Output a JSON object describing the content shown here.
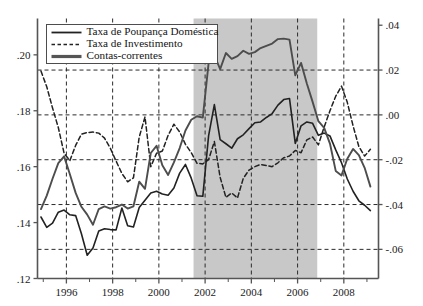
{
  "chart_data": {
    "type": "line",
    "title": "",
    "subtitle": "",
    "xlabel": "",
    "ylabel": "",
    "y2label": "",
    "grid": true,
    "legend_position": "top-left",
    "xlim": [
      1994.75,
      2009.5
    ],
    "ylim": [
      0.12,
      0.213
    ],
    "y2lim": [
      -0.073,
      0.043
    ],
    "xticks": [
      1996,
      1998,
      2000,
      2002,
      2004,
      2006,
      2008
    ],
    "xticklabels": [
      "1996",
      "1998",
      "2000",
      "2002",
      "2004",
      "2006",
      "2008"
    ],
    "xminorticks": [
      1995,
      1997,
      1999,
      2001,
      2003,
      2005,
      2007,
      2009
    ],
    "yticks": [
      0.12,
      0.14,
      0.16,
      0.18,
      0.2
    ],
    "yticklabels": [
      ".12",
      ".14",
      ".16",
      ".18",
      ".20"
    ],
    "y2ticks": [
      -0.06,
      -0.04,
      -0.02,
      0.0,
      0.02,
      0.04
    ],
    "y2ticklabels": [
      "-.06",
      "-.04",
      "-.02",
      ".00",
      ".02",
      ".04"
    ],
    "shaded_regions": [
      {
        "x0": 2001.5,
        "x1": 2006.85,
        "color": "#c8c8c8",
        "label": ""
      }
    ],
    "legend": [
      {
        "label": "Taxa de Poupança Doméstica",
        "style": "solid",
        "width": 1.6,
        "color": "#222222"
      },
      {
        "label": "Taxa de Investimento",
        "style": "dashed",
        "width": 1.4,
        "color": "#222222"
      },
      {
        "label": "Contas-correntes",
        "style": "thick-solid",
        "width": 3.2,
        "color": "#555555"
      }
    ],
    "series": [
      {
        "name": "Taxa de Poupança Doméstica",
        "axis": "left",
        "style": "solid",
        "color": "#222222",
        "x": [
          1994.9,
          1995.15,
          1995.4,
          1995.65,
          1995.9,
          1996.15,
          1996.4,
          1996.65,
          1996.9,
          1997.15,
          1997.4,
          1997.65,
          1997.9,
          1998.15,
          1998.4,
          1998.65,
          1998.9,
          1999.15,
          1999.4,
          1999.65,
          1999.9,
          2000.15,
          2000.4,
          2000.65,
          2000.9,
          2001.15,
          2001.4,
          2001.65,
          2001.9,
          2002.15,
          2002.4,
          2002.65,
          2002.9,
          2003.15,
          2003.4,
          2003.65,
          2003.9,
          2004.15,
          2004.4,
          2004.65,
          2004.9,
          2005.15,
          2005.4,
          2005.65,
          2005.9,
          2006.15,
          2006.4,
          2006.65,
          2006.9,
          2007.15,
          2007.4,
          2007.65,
          2007.9,
          2008.15,
          2008.4,
          2008.65,
          2008.9,
          2009.15
        ],
        "values": [
          0.142,
          0.1383,
          0.1398,
          0.1437,
          0.1445,
          0.1428,
          0.1425,
          0.136,
          0.1283,
          0.1309,
          0.137,
          0.1378,
          0.1375,
          0.1374,
          0.1452,
          0.1389,
          0.1384,
          0.1454,
          0.148,
          0.1506,
          0.1512,
          0.1502,
          0.1498,
          0.1524,
          0.1577,
          0.1608,
          0.1559,
          0.1496,
          0.1494,
          0.171,
          0.1822,
          0.1697,
          0.1682,
          0.1666,
          0.17,
          0.1714,
          0.1736,
          0.1757,
          0.176,
          0.1776,
          0.179,
          0.182,
          0.184,
          0.1844,
          0.1683,
          0.1746,
          0.176,
          0.1755,
          0.1712,
          0.172,
          0.171,
          0.166,
          0.1614,
          0.1556,
          0.1512,
          0.1478,
          0.1462,
          0.1443
        ]
      },
      {
        "name": "Taxa de Investimento",
        "axis": "left",
        "style": "dashed",
        "color": "#222222",
        "x": [
          1994.9,
          1995.15,
          1995.4,
          1995.65,
          1995.9,
          1996.15,
          1996.4,
          1996.65,
          1996.9,
          1997.15,
          1997.4,
          1997.65,
          1997.9,
          1998.15,
          1998.4,
          1998.65,
          1998.9,
          1999.15,
          1999.4,
          1999.65,
          1999.9,
          2000.15,
          2000.4,
          2000.65,
          2000.9,
          2001.15,
          2001.4,
          2001.65,
          2001.9,
          2002.15,
          2002.4,
          2002.65,
          2002.9,
          2003.15,
          2003.4,
          2003.65,
          2003.9,
          2004.15,
          2004.4,
          2004.65,
          2004.9,
          2005.15,
          2005.4,
          2005.65,
          2005.9,
          2006.15,
          2006.4,
          2006.65,
          2006.9,
          2007.15,
          2007.4,
          2007.65,
          2007.9,
          2008.15,
          2008.4,
          2008.65,
          2008.9,
          2009.15
        ],
        "values": [
          0.1942,
          0.1886,
          0.181,
          0.174,
          0.1648,
          0.1622,
          0.1676,
          0.1716,
          0.1722,
          0.1724,
          0.172,
          0.1702,
          0.1666,
          0.162,
          0.1576,
          0.1546,
          0.156,
          0.1706,
          0.1778,
          0.16,
          0.1648,
          0.1656,
          0.1712,
          0.1752,
          0.1724,
          0.168,
          0.165,
          0.1612,
          0.161,
          0.1625,
          0.169,
          0.1562,
          0.149,
          0.1506,
          0.1488,
          0.1558,
          0.1588,
          0.16,
          0.1608,
          0.1604,
          0.16,
          0.1614,
          0.1632,
          0.1638,
          0.1658,
          0.165,
          0.1696,
          0.1706,
          0.1678,
          0.1742,
          0.18,
          0.1852,
          0.1888,
          0.183,
          0.1746,
          0.1672,
          0.1638,
          0.1662
        ]
      },
      {
        "name": "Contas-correntes",
        "axis": "right",
        "style": "thick-solid",
        "color": "#4d4d4d",
        "x": [
          1994.9,
          1995.15,
          1995.4,
          1995.65,
          1995.9,
          1996.15,
          1996.4,
          1996.65,
          1996.9,
          1997.15,
          1997.4,
          1997.65,
          1997.9,
          1998.15,
          1998.4,
          1998.65,
          1998.9,
          1999.15,
          1999.4,
          1999.65,
          1999.9,
          2000.15,
          2000.4,
          2000.65,
          2000.9,
          2001.15,
          2001.4,
          2001.65,
          2001.9,
          2002.15,
          2002.4,
          2002.65,
          2002.9,
          2003.15,
          2003.4,
          2003.65,
          2003.9,
          2004.15,
          2004.4,
          2004.65,
          2004.9,
          2005.15,
          2005.4,
          2005.65,
          2005.9,
          2006.15,
          2006.4,
          2006.65,
          2006.9,
          2007.15,
          2007.4,
          2007.65,
          2007.9,
          2008.15,
          2008.4,
          2008.65,
          2008.9,
          2009.15
        ],
        "values": [
          -0.042,
          -0.036,
          -0.0285,
          -0.0215,
          -0.0185,
          -0.0265,
          -0.0348,
          -0.041,
          -0.0445,
          -0.049,
          -0.042,
          -0.0408,
          -0.0418,
          -0.0412,
          -0.04,
          -0.0418,
          -0.0408,
          -0.0298,
          -0.033,
          -0.017,
          -0.0138,
          -0.0225,
          -0.0268,
          -0.0212,
          -0.0148,
          -0.007,
          -0.0022,
          -0.0006,
          -0.0012,
          0.023,
          0.0266,
          0.0204,
          0.0276,
          0.025,
          0.0262,
          0.0286,
          0.0272,
          0.028,
          0.0298,
          0.0308,
          0.0318,
          0.0338,
          0.034,
          0.0336,
          0.0176,
          0.0232,
          0.014,
          0.0058,
          -0.0028,
          -0.0058,
          -0.0128,
          -0.025,
          -0.027,
          -0.0196,
          -0.0152,
          -0.018,
          -0.0236,
          -0.032
        ]
      }
    ]
  },
  "colors": {
    "background": "#ffffff",
    "axis": "#555555",
    "grid": "#2b2b2b",
    "shade": "#c8c8c8",
    "savings": "#222222",
    "investment": "#222222",
    "current_account": "#4d4d4d"
  }
}
